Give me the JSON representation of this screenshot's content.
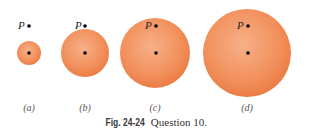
{
  "figure": {
    "caption_label": "Fig. 24-24",
    "caption_text": "Question 10.",
    "point_label": "P",
    "panels": [
      {
        "label": "(a)",
        "cx": 29,
        "cy": 53,
        "r": 12,
        "p_x": 29,
        "p_y": 26
      },
      {
        "label": "(b)",
        "cx": 85,
        "cy": 53,
        "r": 24,
        "p_x": 85,
        "p_y": 26
      },
      {
        "label": "(c)",
        "cx": 155,
        "cy": 53,
        "r": 35,
        "p_x": 156,
        "p_y": 26
      },
      {
        "label": "(d)",
        "cx": 247,
        "cy": 53,
        "r": 44,
        "p_x": 247,
        "p_y": 26
      }
    ],
    "colors": {
      "sphere_fill": "#f2905c",
      "sphere_edge": "#e8773f",
      "dot": "#000000"
    }
  }
}
